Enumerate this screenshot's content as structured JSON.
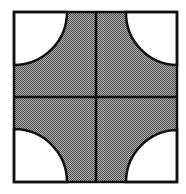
{
  "diagram": {
    "colors": {
      "background": "#ffffff",
      "stroke": "#111111",
      "fill_dark": "#5a5a5a",
      "fill_light": "#b4b4b4",
      "cutout": "#ffffff"
    },
    "square": {
      "x": 14,
      "y": 12,
      "width": 163,
      "height": 170
    },
    "center": {
      "x": 96,
      "y": 97
    },
    "corner_cutouts": [
      {
        "corner": "top-left",
        "radius": 53
      },
      {
        "corner": "top-right",
        "radius": 52
      },
      {
        "corner": "bottom-left",
        "radius": 53
      },
      {
        "corner": "bottom-right",
        "radius": 52
      }
    ],
    "stroke_width": 2.5
  }
}
